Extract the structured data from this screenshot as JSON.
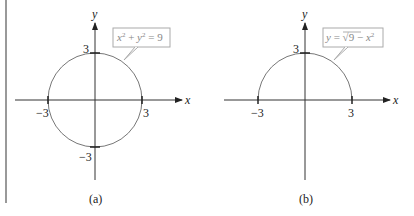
{
  "panels": [
    {
      "id": "a",
      "caption": "(a)",
      "x_axis_label": "x",
      "y_axis_label": "y",
      "tick_labels": {
        "x_neg": "−3",
        "x_pos": "3",
        "y_pos": "3",
        "y_neg": "−3"
      },
      "equation": {
        "lhs_x": "x",
        "exp1": "2",
        "plus": " + ",
        "lhs_y": "y",
        "exp2": "2",
        "rhs": " = 9"
      },
      "curve": "full circle, radius 3"
    },
    {
      "id": "b",
      "caption": "(b)",
      "x_axis_label": "x",
      "y_axis_label": "y",
      "tick_labels": {
        "x_neg": "−3",
        "x_pos": "3",
        "y_pos": "3"
      },
      "equation": {
        "y": "y",
        "eq": " = ",
        "sqrt": "√",
        "inner": "9 − ",
        "x": "x",
        "exp": "2"
      },
      "curve": "upper semicircle, radius 3"
    }
  ],
  "colors": {
    "axis": "#333333",
    "curve": "#777777",
    "callout": "#999999",
    "text": "#222222",
    "divider": "#555555"
  }
}
